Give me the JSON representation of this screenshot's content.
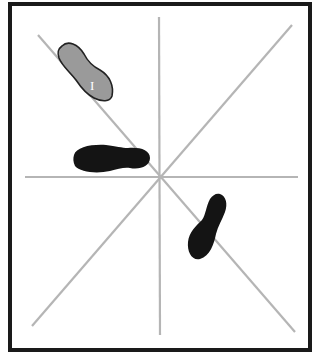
{
  "diagram": {
    "type": "radial-line-diagram",
    "colors": {
      "frame": "#1a1a1a",
      "lines": "#b5b5b5",
      "shape_gray_fill": "#9a9a9a",
      "shape_gray_stroke": "#222222",
      "shape_black_fill": "#141414",
      "background": "#ffffff"
    },
    "lines": [
      {
        "name": "horizontal-line",
        "x1": 25,
        "y1": 177,
        "x2": 298,
        "y2": 177
      },
      {
        "name": "vertical-line",
        "x1": 159,
        "y1": 17,
        "x2": 160,
        "y2": 335
      },
      {
        "name": "diagonal-nw-se-line",
        "x1": 38,
        "y1": 35,
        "x2": 295,
        "y2": 332
      },
      {
        "name": "diagonal-ne-sw-line",
        "x1": 292,
        "y1": 25,
        "x2": 32,
        "y2": 326
      }
    ],
    "shapes": [
      {
        "name": "gray-footprint-shape",
        "label": "I"
      },
      {
        "name": "black-horizontal-footprint-shape",
        "label": ""
      },
      {
        "name": "black-diagonal-footprint-shape",
        "label": ""
      }
    ]
  }
}
